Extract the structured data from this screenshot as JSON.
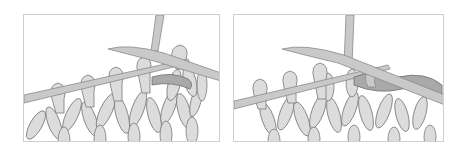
{
  "figure": {
    "panels": [
      {
        "id": "step-1",
        "description": "Right needle inserted into stitch on left needle, working yarn wrapped"
      },
      {
        "id": "step-2",
        "description": "New loop pulled through, stitch slipping off left needle"
      }
    ],
    "colors": {
      "background": "#ffffff",
      "frame": "#cfcfcf",
      "stitch_fill": "#dcdcdc",
      "outline": "#7a7a7a",
      "needle": "#c9c9c9",
      "working_yarn": "#a9a9a9"
    }
  }
}
